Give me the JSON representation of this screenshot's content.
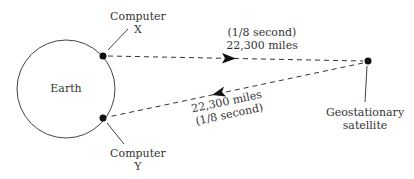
{
  "diagram": {
    "earth_label": "Earth",
    "computer_x": {
      "line1": "Computer",
      "line2": "X"
    },
    "computer_y": {
      "line1": "Computer",
      "line2": "Y"
    },
    "satellite": {
      "line1": "Geostationary",
      "line2": "satellite"
    },
    "uplink": {
      "time": "(1/8 second)",
      "distance": "22,300 miles"
    },
    "downlink": {
      "distance": "22,300 miles",
      "time": "(1/8 second)"
    }
  },
  "colors": {
    "ink": "#333333",
    "background": "#ffffff"
  }
}
